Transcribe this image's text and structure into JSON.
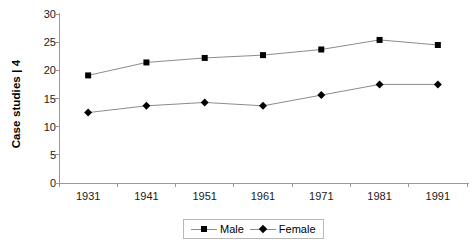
{
  "chart_data": {
    "type": "line",
    "title": "",
    "xlabel": "",
    "ylabel": "Case studies | 4",
    "categories": [
      "1931",
      "1941",
      "1951",
      "1961",
      "1971",
      "1981",
      "1991"
    ],
    "series": [
      {
        "name": "Male",
        "marker": "square",
        "values": [
          19.1,
          21.4,
          22.2,
          22.7,
          23.7,
          25.4,
          24.5
        ]
      },
      {
        "name": "Female",
        "marker": "diamond",
        "values": [
          12.5,
          13.7,
          14.3,
          13.7,
          15.6,
          17.5,
          17.5
        ]
      }
    ],
    "ylim": [
      0,
      30
    ],
    "yticks": [
      0,
      5,
      10,
      15,
      20,
      25,
      30
    ],
    "ytick_labels": [
      "0",
      "5",
      "10",
      "15",
      "20",
      "25",
      "30"
    ],
    "grid": false,
    "legend_position": "bottom-center",
    "colors": {
      "line": "#8c8c8c",
      "marker": "#000000",
      "axis": "#999999",
      "text": "#000000",
      "background": "#ffffff"
    }
  }
}
